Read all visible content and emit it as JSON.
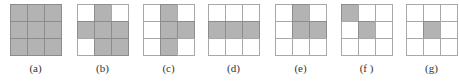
{
  "figure": {
    "colors": {
      "filled": "#b3b3b3",
      "empty": "#ffffff",
      "grid_line": "#a8a8a8"
    },
    "panels": [
      {
        "label": "(a)",
        "left": 10,
        "cells": [
          1,
          1,
          1,
          1,
          1,
          1,
          1,
          1,
          1
        ]
      },
      {
        "label": "(b)",
        "left": 77,
        "cells": [
          0,
          1,
          0,
          1,
          1,
          1,
          0,
          1,
          1
        ]
      },
      {
        "label": "(c)",
        "left": 143,
        "cells": [
          0,
          1,
          0,
          0,
          1,
          1,
          0,
          1,
          0
        ]
      },
      {
        "label": "(d)",
        "left": 208,
        "cells": [
          0,
          0,
          0,
          1,
          1,
          1,
          0,
          0,
          0
        ]
      },
      {
        "label": "(e)",
        "left": 275,
        "cells": [
          0,
          1,
          0,
          0,
          1,
          1,
          0,
          0,
          0
        ]
      },
      {
        "label": "(f )",
        "left": 341,
        "cells": [
          1,
          0,
          0,
          0,
          1,
          0,
          0,
          0,
          0
        ]
      },
      {
        "label": "(g)",
        "left": 406,
        "cells": [
          0,
          0,
          0,
          0,
          1,
          0,
          0,
          0,
          0
        ]
      }
    ]
  }
}
